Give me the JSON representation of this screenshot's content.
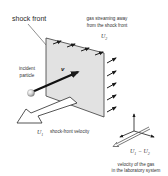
{
  "diagram": {
    "labels": {
      "shock_front": "shock front",
      "gas_streaming_line1": "gas streaming away",
      "gas_streaming_line2": "from the shock front",
      "u2": "U",
      "u2_sub": "2",
      "incident_line1": "incident",
      "incident_line2": "particle",
      "v": "v",
      "u1": "U",
      "u1_sub": "1",
      "shock_front_velocity": "shock-front velocity",
      "u1_minus_u2": "U",
      "u1_minus_u2_sub1": "1",
      "u1_minus_u2_op": " − U",
      "u1_minus_u2_sub2": "2",
      "gas_velocity_line1": "velocity of the gas",
      "gas_velocity_line2": "in the laboratory system"
    },
    "colors": {
      "panel_fill": "#e2e2e2",
      "panel_edge": "#3a3a3a",
      "arrow_dark": "#1a1a1a",
      "particle": "#d8d8d8",
      "text": "#333333"
    }
  }
}
